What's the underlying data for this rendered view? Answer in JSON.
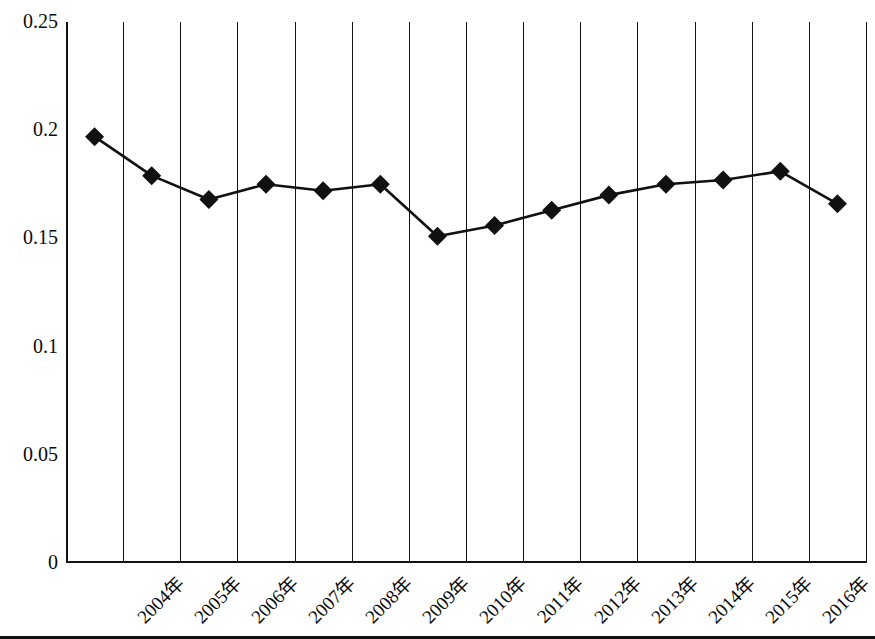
{
  "chart_data": {
    "type": "line",
    "title": "",
    "subtitle": "",
    "xlabel": "",
    "ylabel": "",
    "categories": [
      "2004年",
      "2005年",
      "2006年",
      "2007年",
      "2008年",
      "2009年",
      "2010年",
      "2011年",
      "2012年",
      "2013年",
      "2014年",
      "2015年",
      "2016年",
      "2017年"
    ],
    "values": [
      0.197,
      0.179,
      0.168,
      0.175,
      0.172,
      0.175,
      0.151,
      0.156,
      0.163,
      0.17,
      0.175,
      0.177,
      0.181,
      0.166
    ],
    "ylim": [
      0,
      0.25
    ],
    "ytick_labels": [
      "0.25",
      "0.2",
      "0.15",
      "0.1",
      "0.05",
      "0"
    ],
    "ytick_values": [
      0.25,
      0.2,
      0.15,
      0.1,
      0.05,
      0
    ],
    "grid": "vertical",
    "legend": "none",
    "marker": "diamond",
    "line_color": "#111111",
    "marker_color": "#111111",
    "axis_color": "#111111",
    "grid_color": "#111111",
    "background": "#ffffff",
    "annotations": []
  }
}
